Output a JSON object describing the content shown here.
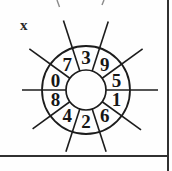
{
  "figure": {
    "label": "x",
    "wheel": {
      "type": "circular-number-dial",
      "sector_count": 10,
      "numbers_clockwise_from_top": [
        "3",
        "9",
        "5",
        "1",
        "6",
        "2",
        "4",
        "8",
        "0",
        "7"
      ],
      "line_color": "#1c1c1c",
      "digit_color": "#161616",
      "background": "#fefefe"
    },
    "frame": {
      "border_color": "#303030"
    }
  }
}
